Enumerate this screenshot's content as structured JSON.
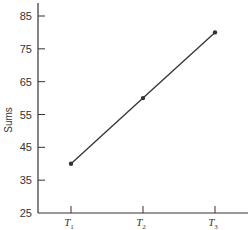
{
  "chart_data": {
    "type": "line",
    "title": "",
    "xlabel": "",
    "ylabel": "Sums",
    "categories": [
      "T1",
      "T2",
      "T3"
    ],
    "category_labels": [
      {
        "base": "T",
        "sub": "1"
      },
      {
        "base": "T",
        "sub": "2"
      },
      {
        "base": "T",
        "sub": "3"
      }
    ],
    "series": [
      {
        "name": "Sums",
        "values": [
          40,
          60,
          80
        ],
        "color": "#333333"
      }
    ],
    "ylim": [
      25,
      90
    ],
    "yticks": [
      25,
      35,
      45,
      55,
      65,
      75,
      85
    ],
    "grid": false,
    "legend": null
  }
}
